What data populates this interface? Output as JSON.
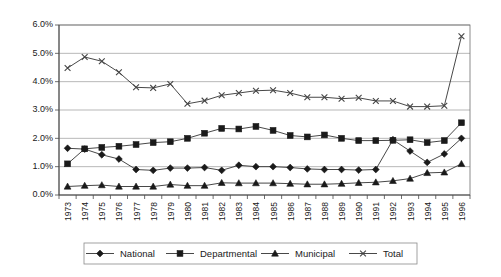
{
  "chart_data": {
    "type": "line",
    "title": "",
    "subtitle": "",
    "xlabel": "",
    "ylabel": "",
    "grid": true,
    "legend_position": "bottom",
    "ylim": [
      0.0,
      6.0
    ],
    "ytick_labels": [
      "0.0%",
      "1.0%",
      "2.0%",
      "3.0%",
      "4.0%",
      "5.0%",
      "6.0%"
    ],
    "ytick_values": [
      0.0,
      1.0,
      2.0,
      3.0,
      4.0,
      5.0,
      6.0
    ],
    "categories": [
      "1973",
      "1974",
      "1975",
      "1976",
      "1977",
      "1978",
      "1979",
      "1980",
      "1981",
      "1982",
      "1983",
      "1984",
      "1985",
      "1986",
      "1987",
      "1988",
      "1989",
      "1990",
      "1991",
      "1992",
      "1993",
      "1994",
      "1995",
      "1996"
    ],
    "x": [
      1973,
      1974,
      1975,
      1976,
      1977,
      1978,
      1979,
      1980,
      1981,
      1982,
      1983,
      1984,
      1985,
      1986,
      1987,
      1988,
      1989,
      1990,
      1991,
      1992,
      1993,
      1994,
      1995,
      1996
    ],
    "series": [
      {
        "name": "National",
        "marker": "diamond",
        "values": [
          1.65,
          1.62,
          1.42,
          1.27,
          0.9,
          0.87,
          0.95,
          0.95,
          0.97,
          0.87,
          1.05,
          1.0,
          1.0,
          0.97,
          0.92,
          0.9,
          0.9,
          0.88,
          0.9,
          1.95,
          1.55,
          1.15,
          1.45,
          2.0
        ]
      },
      {
        "name": "Departmental",
        "marker": "square",
        "values": [
          1.1,
          1.63,
          1.68,
          1.72,
          1.78,
          1.85,
          1.88,
          2.0,
          2.18,
          2.35,
          2.33,
          2.42,
          2.28,
          2.1,
          2.05,
          2.12,
          2.0,
          1.92,
          1.92,
          1.93,
          1.95,
          1.85,
          1.92,
          2.55
        ]
      },
      {
        "name": "Municipal",
        "marker": "triangle",
        "values": [
          0.3,
          0.33,
          0.35,
          0.3,
          0.3,
          0.3,
          0.37,
          0.33,
          0.33,
          0.43,
          0.42,
          0.42,
          0.42,
          0.4,
          0.38,
          0.38,
          0.4,
          0.43,
          0.45,
          0.5,
          0.58,
          0.78,
          0.8,
          1.1
        ]
      },
      {
        "name": "Total",
        "marker": "cross",
        "values": [
          4.48,
          4.87,
          4.72,
          4.33,
          3.8,
          3.78,
          3.92,
          3.22,
          3.33,
          3.52,
          3.6,
          3.68,
          3.7,
          3.6,
          3.45,
          3.45,
          3.4,
          3.43,
          3.32,
          3.32,
          3.12,
          3.12,
          3.15,
          5.6
        ]
      }
    ]
  },
  "legend": {
    "entries": [
      {
        "label": "National",
        "marker": "diamond"
      },
      {
        "label": "Departmental",
        "marker": "square"
      },
      {
        "label": "Municipal",
        "marker": "triangle"
      },
      {
        "label": "Total",
        "marker": "cross"
      }
    ]
  },
  "colors": {
    "series_stroke": "#333333",
    "marker_fill": "#1a1a1a",
    "gridline": "#9a9a9a",
    "axis": "#4a4a4a",
    "background": "#ffffff"
  }
}
